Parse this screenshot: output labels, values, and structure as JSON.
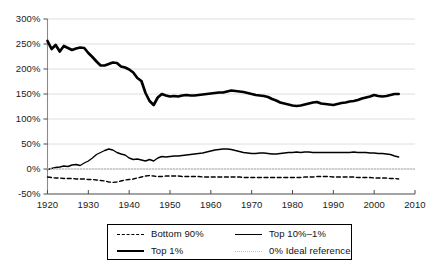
{
  "chart_data": {
    "type": "line",
    "title": "",
    "subtitle": "",
    "xlabel": "",
    "ylabel": "",
    "xlim": [
      1920,
      2010
    ],
    "ylim": [
      -50,
      300
    ],
    "ytick_labels": [
      "300%",
      "250%",
      "200%",
      "150%",
      "100%",
      "50%",
      "0%",
      "-50%"
    ],
    "ytick_values": [
      300,
      250,
      200,
      150,
      100,
      50,
      0,
      -50
    ],
    "xtick_labels": [
      "1920",
      "1930",
      "1940",
      "1950",
      "1960",
      "1970",
      "1980",
      "1990",
      "2000",
      "2010"
    ],
    "xtick_values": [
      1920,
      1930,
      1940,
      1950,
      1960,
      1970,
      1980,
      1990,
      2000,
      2010
    ],
    "grid": "horizontal",
    "legend_position": "below-center",
    "series": [
      {
        "name": "Bottom 90%",
        "style": "dashed",
        "color": "#000000",
        "x": [
          1920,
          1921,
          1922,
          1923,
          1924,
          1925,
          1926,
          1927,
          1928,
          1929,
          1930,
          1931,
          1932,
          1933,
          1934,
          1935,
          1936,
          1937,
          1938,
          1939,
          1940,
          1941,
          1942,
          1943,
          1944,
          1945,
          1946,
          1947,
          1948,
          1949,
          1950,
          1951,
          1952,
          1953,
          1954,
          1955,
          1956,
          1957,
          1958,
          1959,
          1960,
          1961,
          1962,
          1963,
          1964,
          1965,
          1966,
          1967,
          1968,
          1969,
          1970,
          1971,
          1972,
          1973,
          1974,
          1975,
          1976,
          1977,
          1978,
          1979,
          1980,
          1981,
          1982,
          1983,
          1984,
          1985,
          1986,
          1987,
          1988,
          1989,
          1990,
          1991,
          1992,
          1993,
          1994,
          1995,
          1996,
          1997,
          1998,
          1999,
          2000,
          2001,
          2002,
          2003,
          2004,
          2005,
          2006
        ],
        "values": [
          -16,
          -17,
          -18,
          -18,
          -19,
          -19,
          -19,
          -20,
          -20,
          -20,
          -21,
          -21,
          -22,
          -23,
          -24,
          -26,
          -27,
          -26,
          -24,
          -22,
          -21,
          -20,
          -18,
          -16,
          -14,
          -13,
          -14,
          -15,
          -15,
          -14,
          -14,
          -14,
          -14,
          -15,
          -15,
          -15,
          -15,
          -15,
          -16,
          -16,
          -16,
          -16,
          -16,
          -16,
          -16,
          -16,
          -16,
          -16,
          -17,
          -17,
          -17,
          -17,
          -17,
          -17,
          -17,
          -17,
          -17,
          -17,
          -17,
          -17,
          -17,
          -17,
          -17,
          -16,
          -16,
          -16,
          -15,
          -15,
          -15,
          -15,
          -16,
          -16,
          -16,
          -16,
          -16,
          -16,
          -17,
          -17,
          -17,
          -17,
          -18,
          -18,
          -18,
          -18,
          -19,
          -19,
          -20
        ]
      },
      {
        "name": "Top 1%",
        "style": "thick",
        "color": "#000000",
        "x": [
          1920,
          1921,
          1922,
          1923,
          1924,
          1925,
          1926,
          1927,
          1928,
          1929,
          1930,
          1931,
          1932,
          1933,
          1934,
          1935,
          1936,
          1937,
          1938,
          1939,
          1940,
          1941,
          1942,
          1943,
          1944,
          1945,
          1946,
          1947,
          1948,
          1949,
          1950,
          1951,
          1952,
          1953,
          1954,
          1955,
          1956,
          1957,
          1958,
          1959,
          1960,
          1961,
          1962,
          1963,
          1964,
          1965,
          1966,
          1967,
          1968,
          1969,
          1970,
          1971,
          1972,
          1973,
          1974,
          1975,
          1976,
          1977,
          1978,
          1979,
          1980,
          1981,
          1982,
          1983,
          1984,
          1985,
          1986,
          1987,
          1988,
          1989,
          1990,
          1991,
          1992,
          1993,
          1994,
          1995,
          1996,
          1997,
          1998,
          1999,
          2000,
          2001,
          2002,
          2003,
          2004,
          2005,
          2006
        ],
        "values": [
          256,
          240,
          248,
          235,
          246,
          242,
          238,
          241,
          243,
          242,
          232,
          224,
          215,
          207,
          207,
          210,
          213,
          212,
          205,
          203,
          199,
          193,
          182,
          176,
          152,
          136,
          128,
          143,
          150,
          147,
          145,
          146,
          145,
          147,
          148,
          147,
          147,
          148,
          149,
          150,
          151,
          152,
          153,
          153,
          155,
          157,
          156,
          155,
          154,
          152,
          150,
          148,
          147,
          146,
          144,
          140,
          137,
          133,
          131,
          129,
          127,
          126,
          127,
          129,
          131,
          133,
          134,
          131,
          130,
          129,
          128,
          130,
          132,
          133,
          135,
          136,
          138,
          141,
          143,
          145,
          148,
          146,
          145,
          146,
          148,
          150,
          150
        ]
      },
      {
        "name": "Top 10%–1%",
        "style": "thin",
        "color": "#000000",
        "x": [
          1920,
          1921,
          1922,
          1923,
          1924,
          1925,
          1926,
          1927,
          1928,
          1929,
          1930,
          1931,
          1932,
          1933,
          1934,
          1935,
          1936,
          1937,
          1938,
          1939,
          1940,
          1941,
          1942,
          1943,
          1944,
          1945,
          1946,
          1947,
          1948,
          1949,
          1950,
          1951,
          1952,
          1953,
          1954,
          1955,
          1956,
          1957,
          1958,
          1959,
          1960,
          1961,
          1962,
          1963,
          1964,
          1965,
          1966,
          1967,
          1968,
          1969,
          1970,
          1971,
          1972,
          1973,
          1974,
          1975,
          1976,
          1977,
          1978,
          1979,
          1980,
          1981,
          1982,
          1983,
          1984,
          1985,
          1986,
          1987,
          1988,
          1989,
          1990,
          1991,
          1992,
          1993,
          1994,
          1995,
          1996,
          1997,
          1998,
          1999,
          2000,
          2001,
          2002,
          2003,
          2004,
          2005,
          2006
        ],
        "values": [
          -1,
          1,
          3,
          4,
          6,
          5,
          8,
          9,
          7,
          12,
          16,
          22,
          29,
          33,
          37,
          40,
          38,
          33,
          30,
          28,
          22,
          19,
          20,
          18,
          16,
          19,
          16,
          22,
          25,
          24,
          25,
          26,
          26,
          27,
          28,
          29,
          30,
          31,
          32,
          34,
          36,
          38,
          39,
          40,
          40,
          39,
          37,
          35,
          33,
          32,
          31,
          31,
          32,
          32,
          31,
          30,
          30,
          31,
          32,
          33,
          33,
          34,
          33,
          34,
          34,
          33,
          33,
          33,
          33,
          33,
          33,
          33,
          33,
          33,
          33,
          34,
          33,
          33,
          33,
          32,
          32,
          31,
          31,
          30,
          29,
          26,
          24
        ]
      },
      {
        "name": "0% Ideal reference",
        "style": "dotted",
        "color": "#bfbfbf",
        "x": [
          1920,
          2010
        ],
        "values": [
          0,
          0
        ]
      }
    ]
  },
  "legend": {
    "entries": [
      {
        "label": "Bottom 90%"
      },
      {
        "label": "Top 10%–1%"
      },
      {
        "label": "Top 1%"
      },
      {
        "label": "0% Ideal reference"
      }
    ]
  }
}
